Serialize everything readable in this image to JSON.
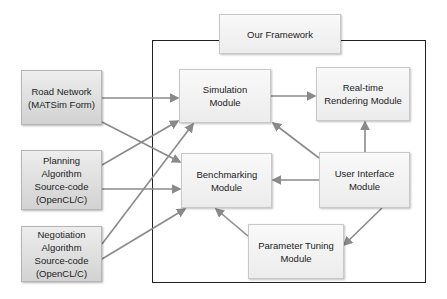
{
  "diagram": {
    "framework": {
      "label": "Our Framework"
    },
    "inputs": [
      {
        "id": "road",
        "label": "Road Network (MATSim Form)"
      },
      {
        "id": "planning",
        "label": "Planning Algorithm Source-code (OpenCL/C)"
      },
      {
        "id": "negotiation",
        "label": "Negotiation Algorithm Source-code (OpenCL/C)"
      }
    ],
    "modules": [
      {
        "id": "simulation",
        "label": "Simulation Module"
      },
      {
        "id": "rendering",
        "label": "Real-time Rendering Module"
      },
      {
        "id": "benchmarking",
        "label": "Benchmarking Module"
      },
      {
        "id": "ui",
        "label": "User Interface Module"
      },
      {
        "id": "tuning",
        "label": "Parameter Tuning Module"
      }
    ],
    "edges": [
      [
        "road",
        "simulation"
      ],
      [
        "road",
        "benchmarking"
      ],
      [
        "planning",
        "simulation"
      ],
      [
        "planning",
        "benchmarking"
      ],
      [
        "negotiation",
        "simulation"
      ],
      [
        "negotiation",
        "benchmarking"
      ],
      [
        "simulation",
        "rendering"
      ],
      [
        "ui",
        "simulation"
      ],
      [
        "ui",
        "rendering"
      ],
      [
        "ui",
        "benchmarking"
      ],
      [
        "ui",
        "tuning"
      ],
      [
        "tuning",
        "benchmarking"
      ]
    ],
    "colors": {
      "arrow": "#8a8a8a",
      "frame": "#222222"
    }
  }
}
